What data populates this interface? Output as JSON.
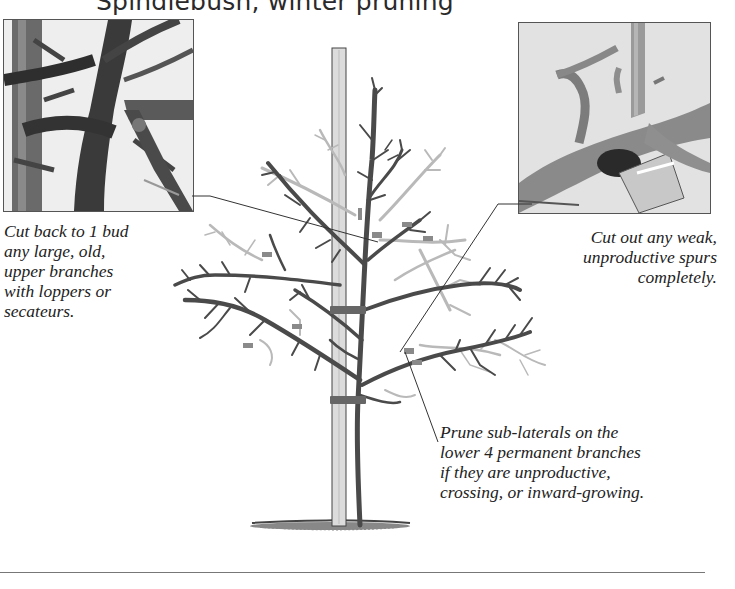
{
  "title": "Spindlebush, winter pruning",
  "photos": {
    "left": {
      "subject": "loppers cutting large upper branch"
    },
    "right": {
      "subject": "secateurs cutting out weak spur"
    }
  },
  "captions": {
    "left": {
      "lines": [
        "Cut back to 1 bud",
        "any large, old,",
        "upper branches",
        "with loppers or",
        "secateurs."
      ]
    },
    "right": {
      "lines": [
        "Cut out any weak,",
        "unproductive spurs",
        "completely."
      ]
    },
    "bottom": {
      "lines": [
        "Prune sub-laterals on the",
        "lower 4 permanent branches",
        "if they are unproductive,",
        "crossing, or inward-growing."
      ]
    }
  },
  "illustration": {
    "subject": "staked spindlebush tree with pruned branches shown in light grey",
    "colors": {
      "retained_branches": "#4a4a4a",
      "removed_branches": "#b8b8b8",
      "cut_marks": "#8a8a8a",
      "stake": "#d8d8d8"
    }
  }
}
